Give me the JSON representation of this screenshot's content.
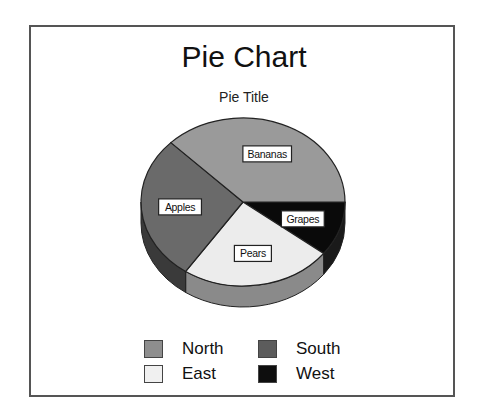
{
  "chart_data": {
    "type": "pie",
    "title": "Pie Chart",
    "subtitle": "Pie Title",
    "style": "3d-pie",
    "slices": [
      {
        "label": "Grapes",
        "value": 10.5,
        "color": "#0a0a0a",
        "side": "#1a1a1a"
      },
      {
        "label": "Pears",
        "value": 24,
        "color": "#ececec",
        "side": "#8a8a8a"
      },
      {
        "label": "Apples",
        "value": 28,
        "color": "#6a6a6a",
        "side": "#3a3a3a"
      },
      {
        "label": "Bananas",
        "value": 37.5,
        "color": "#9a9a9a",
        "side": "#7a7a7a"
      }
    ],
    "legend": [
      {
        "label": "North",
        "color": "#8e8e8e"
      },
      {
        "label": "South",
        "color": "#5c5c5c"
      },
      {
        "label": "East",
        "color": "#f0f0f0"
      },
      {
        "label": "West",
        "color": "#0e0e0e"
      }
    ],
    "legend_position": "bottom"
  }
}
